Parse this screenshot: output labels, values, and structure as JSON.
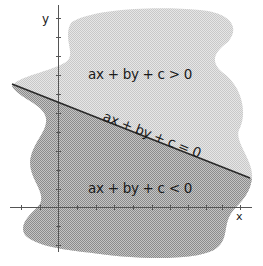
{
  "diagram": {
    "axes": {
      "x_label": "x",
      "y_label": "y"
    },
    "regions": {
      "upper": {
        "label": "ax + by + c > 0",
        "color": "#d9d9d9"
      },
      "lower": {
        "label": "ax + by + c < 0",
        "color": "#a8a8a8"
      }
    },
    "line": {
      "label": "ax + by + c = 0",
      "color": "#2a2a2a"
    },
    "axis_color": "#555555"
  }
}
